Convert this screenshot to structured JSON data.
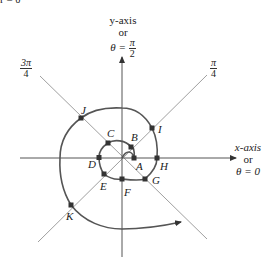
{
  "figure": {
    "header_fragment": "r = θ",
    "y_axis_label": {
      "line1": "y-axis",
      "line2": "or",
      "theta": "θ =",
      "num": "π",
      "den": "2"
    },
    "x_axis_label": {
      "line1": "x-axis",
      "line2": "or",
      "line3": "θ = 0"
    },
    "angle_labels": [
      {
        "name": "three-pi-over-four",
        "num": "3π",
        "den": "4"
      },
      {
        "name": "pi-over-four",
        "num": "π",
        "den": "4"
      }
    ],
    "points": [
      {
        "label": "A"
      },
      {
        "label": "B"
      },
      {
        "label": "C"
      },
      {
        "label": "D"
      },
      {
        "label": "E"
      },
      {
        "label": "F"
      },
      {
        "label": "G"
      },
      {
        "label": "H"
      },
      {
        "label": "I"
      },
      {
        "label": "J"
      },
      {
        "label": "K"
      }
    ],
    "colors": {
      "axis": "#444444",
      "diagonal": "#9a9a9a",
      "spiral": "#555555",
      "point": "#333333"
    }
  }
}
